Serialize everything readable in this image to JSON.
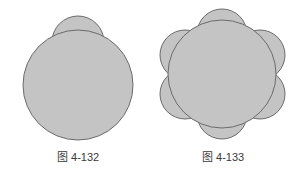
{
  "figures": [
    {
      "caption": "图 4-132",
      "description": "large circle with one small circle overlapping at top",
      "fill": "#c4c4c4",
      "stroke": "#6b6b6b"
    },
    {
      "caption": "图 4-133",
      "description": "large circle with six small circles arranged around it like petals",
      "fill": "#c4c4c4",
      "stroke": "#6b6b6b"
    }
  ]
}
